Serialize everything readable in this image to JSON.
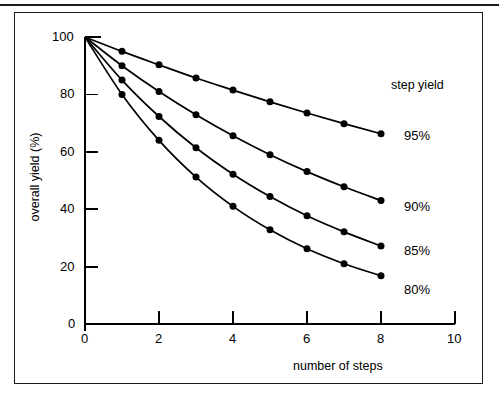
{
  "chart_data": {
    "type": "line",
    "title": "",
    "xlabel": "number of steps",
    "ylabel": "overall yield (%)",
    "xlim": [
      0,
      10
    ],
    "ylim": [
      0,
      100
    ],
    "xticks": [
      "0",
      "2",
      "4",
      "6",
      "8",
      "10"
    ],
    "xtick_values": [
      0,
      2,
      4,
      6,
      8,
      10
    ],
    "yticks": [
      "0",
      "20",
      "40",
      "60",
      "80",
      "100"
    ],
    "ytick_values": [
      0,
      20,
      40,
      60,
      80,
      100
    ],
    "grid": false,
    "legend_position": "right",
    "legend_title": "step yield",
    "x": [
      0,
      1,
      2,
      3,
      4,
      5,
      6,
      7,
      8
    ],
    "series": [
      {
        "name": "95%",
        "step_yield": 0.95,
        "values": [
          100,
          95,
          90.3,
          85.7,
          81.5,
          77.4,
          73.5,
          69.8,
          66.3
        ],
        "label": "95%"
      },
      {
        "name": "90%",
        "step_yield": 0.9,
        "values": [
          100,
          90,
          81,
          72.9,
          65.6,
          59,
          53.1,
          47.8,
          43
        ],
        "label": "90%"
      },
      {
        "name": "85%",
        "step_yield": 0.85,
        "values": [
          100,
          85,
          72.3,
          61.4,
          52.2,
          44.4,
          37.7,
          32.1,
          27.2
        ],
        "label": "85%"
      },
      {
        "name": "80%",
        "step_yield": 0.8,
        "values": [
          100,
          80,
          64,
          51.2,
          41,
          32.8,
          26.2,
          21,
          16.8
        ],
        "label": "80%"
      }
    ],
    "marker": "filled-circle",
    "line_color": "#000000",
    "marker_color": "#000000",
    "background_color": "#ffffff"
  },
  "axes": {
    "y_title": "overall yield (%)",
    "x_title": "number of steps",
    "ytick_labels": [
      "100",
      "80",
      "60",
      "40",
      "20",
      "0"
    ],
    "xtick_labels": [
      "0",
      "2",
      "4",
      "6",
      "8",
      "10"
    ]
  },
  "legend": {
    "title": "step yield",
    "entries": [
      "95%",
      "90%",
      "85%",
      "80%"
    ]
  },
  "colors": {
    "ink": "#1a1a1a",
    "plot_line": "#000000",
    "background": "#ffffff"
  }
}
